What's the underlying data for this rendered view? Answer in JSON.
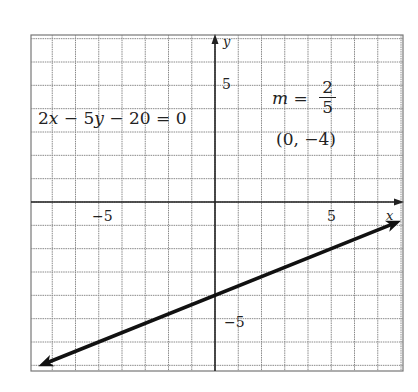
{
  "chart_data": {
    "type": "line",
    "title": "",
    "xlabel": "x",
    "ylabel": "y",
    "xlim": [
      -8,
      8
    ],
    "ylim": [
      -7.2,
      7.2
    ],
    "grid": true,
    "grid_step": 1,
    "x_ticks": [
      {
        "value": -5,
        "label": "−5"
      },
      {
        "value": 5,
        "label": "5"
      }
    ],
    "y_ticks": [
      {
        "value": 5,
        "label": "5"
      },
      {
        "value": -5,
        "label": "−5"
      }
    ],
    "series": [
      {
        "name": "2x − 5y − 20 = 0",
        "equation": "y = (2/5)x − 4",
        "slope": 0.4,
        "intercept": -4,
        "x": [
          -7.6,
          8
        ],
        "y": [
          -7.04,
          -0.8
        ],
        "arrows_both_ends": true
      }
    ],
    "annotations": [
      {
        "text": "2x − 5y − 20 = 0",
        "position": "upper-left"
      },
      {
        "text": "m = 2/5",
        "position": "upper-right"
      },
      {
        "text": "(0, −4)",
        "position": "upper-right"
      }
    ]
  },
  "labels": {
    "equation": {
      "a": "2",
      "x": "x",
      "minus1": " − ",
      "b": "5",
      "y": "y",
      "minus2": " − ",
      "c": "20",
      "eq": " = ",
      "rhs": "0"
    },
    "slope": {
      "m": "m",
      "eq": " = ",
      "num": "2",
      "den": "5"
    },
    "point": "(0, −4)",
    "x_axis_name": "x",
    "y_axis_name": "y",
    "x_tick_neg5": "−5",
    "x_tick_5": "5",
    "y_tick_5": "5",
    "y_tick_neg5": "−5"
  }
}
